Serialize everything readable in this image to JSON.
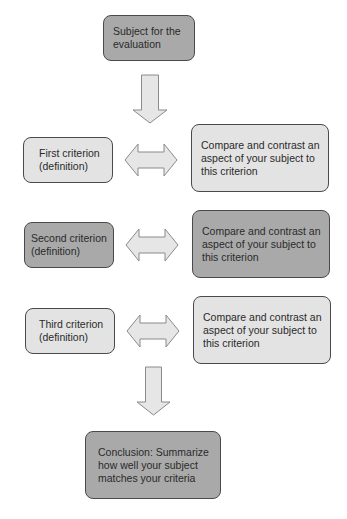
{
  "diagram": {
    "subject": {
      "label": "Subject for the evaluation",
      "line1": "Subject for the",
      "line2": "evaluation",
      "fill": "#a9a9a9"
    },
    "criteria": [
      {
        "label": "First criterion (definition)",
        "line1": "First criterion",
        "line2": "(definition)",
        "fill": "#e3e3e3",
        "compare": {
          "line1": "Compare and contrast an",
          "line2": "aspect of your subject to",
          "line3": "this criterion",
          "fill": "#e3e3e3"
        }
      },
      {
        "label": "Second criterion (definition)",
        "line1": "Second criterion",
        "line2": "(definition)",
        "fill": "#a9a9a9",
        "compare": {
          "line1": "Compare and contrast an",
          "line2": "aspect of your subject to",
          "line3": "this criterion",
          "fill": "#a9a9a9"
        }
      },
      {
        "label": "Third criterion (definition)",
        "line1": "Third criterion",
        "line2": "(definition)",
        "fill": "#e3e3e3",
        "compare": {
          "line1": "Compare and contrast an",
          "line2": "aspect of your subject to",
          "line3": "this criterion",
          "fill": "#e3e3e3"
        }
      }
    ],
    "conclusion": {
      "line1": "Conclusion: Summarize",
      "line2": "how well your subject",
      "line3": "matches your criteria",
      "fill": "#a9a9a9"
    },
    "arrows": {
      "down": "down-arrow",
      "bidirectional": "left-right-arrow",
      "fill": "#e6e6e6",
      "stroke": "#8a8a8a"
    }
  }
}
